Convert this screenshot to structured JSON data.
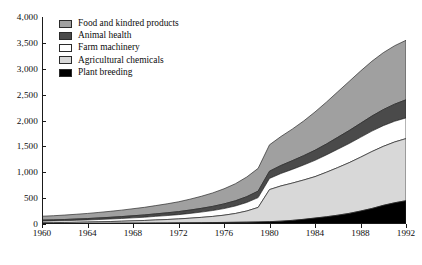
{
  "chart_data": {
    "type": "area",
    "title": "",
    "subtitle": "",
    "xlabel": "",
    "ylabel": "",
    "stacked": true,
    "grid": false,
    "legend_position": "top-left",
    "xlim": [
      1960,
      1992
    ],
    "ylim": [
      0,
      4000
    ],
    "y_ticks": [
      0,
      500,
      1000,
      1500,
      2000,
      2500,
      3000,
      3500,
      4000
    ],
    "y_tick_labels": [
      "0",
      "500",
      "1,000",
      "1,500",
      "2,000",
      "2,500",
      "3,000",
      "3,500",
      "4,000"
    ],
    "x_ticks": [
      1960,
      1964,
      1968,
      1972,
      1976,
      1980,
      1984,
      1988,
      1992
    ],
    "x_tick_labels": [
      "1960",
      "1964",
      "1968",
      "1972",
      "1976",
      "1980",
      "1984",
      "1988",
      "1992"
    ],
    "x": [
      1960,
      1961,
      1962,
      1963,
      1964,
      1965,
      1966,
      1967,
      1968,
      1969,
      1970,
      1971,
      1972,
      1973,
      1974,
      1975,
      1976,
      1977,
      1978,
      1979,
      1980,
      1981,
      1982,
      1983,
      1984,
      1985,
      1986,
      1987,
      1988,
      1989,
      1990,
      1991,
      1992
    ],
    "series": [
      {
        "name": "Plant breeding",
        "color": "#000000",
        "values": [
          10,
          10,
          11,
          12,
          13,
          14,
          15,
          16,
          17,
          18,
          20,
          21,
          22,
          24,
          26,
          28,
          30,
          33,
          36,
          40,
          45,
          55,
          70,
          90,
          115,
          140,
          170,
          205,
          250,
          300,
          360,
          410,
          450
        ]
      },
      {
        "name": "Agricultural chemicals",
        "color": "#d8d8d8",
        "values": [
          15,
          17,
          19,
          22,
          25,
          29,
          33,
          38,
          44,
          50,
          58,
          66,
          76,
          88,
          102,
          118,
          140,
          170,
          215,
          280,
          620,
          680,
          720,
          760,
          800,
          860,
          920,
          980,
          1040,
          1100,
          1140,
          1175,
          1200
        ]
      },
      {
        "name": "Farm machinery",
        "color": "#ffffff",
        "values": [
          30,
          32,
          34,
          37,
          40,
          44,
          48,
          53,
          58,
          63,
          70,
          76,
          83,
          92,
          102,
          114,
          128,
          145,
          165,
          190,
          215,
          240,
          265,
          290,
          315,
          335,
          355,
          370,
          385,
          395,
          400,
          400,
          400
        ]
      },
      {
        "name": "Animal health",
        "color": "#4a4a4a",
        "values": [
          20,
          21,
          23,
          25,
          27,
          30,
          33,
          36,
          40,
          44,
          48,
          53,
          58,
          65,
          72,
          80,
          90,
          100,
          112,
          125,
          140,
          155,
          168,
          180,
          195,
          210,
          230,
          250,
          270,
          290,
          310,
          330,
          350
        ]
      },
      {
        "name": "Food and kindred products",
        "color": "#a0a0a0",
        "values": [
          75,
          80,
          86,
          92,
          99,
          107,
          116,
          125,
          136,
          147,
          160,
          174,
          190,
          210,
          233,
          260,
          292,
          330,
          380,
          440,
          510,
          560,
          610,
          670,
          740,
          810,
          880,
          950,
          1010,
          1060,
          1100,
          1130,
          1150
        ]
      }
    ]
  },
  "legend": {
    "items": [
      {
        "label": "Food and kindred products",
        "color": "#a0a0a0"
      },
      {
        "label": "Animal health",
        "color": "#4a4a4a"
      },
      {
        "label": "Farm machinery",
        "color": "#ffffff"
      },
      {
        "label": "Agricultural chemicals",
        "color": "#d8d8d8"
      },
      {
        "label": "Plant breeding",
        "color": "#000000"
      }
    ]
  }
}
